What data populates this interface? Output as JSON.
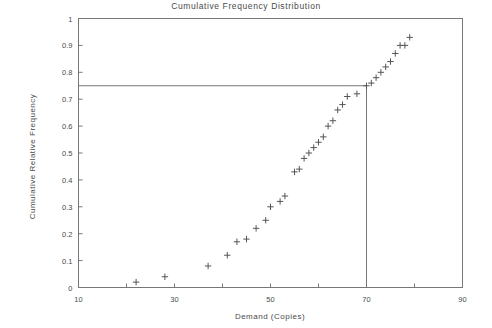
{
  "chart_data": {
    "type": "scatter",
    "title": "Cumulative Frequency Distribution",
    "xlabel": "Demand (Copies)",
    "ylabel": "Cumulative Relative Frequency",
    "xlim": [
      10,
      90
    ],
    "ylim": [
      0,
      1
    ],
    "grid": false,
    "legend": null,
    "marker": "+",
    "marker_color": "#555555",
    "xticks": [
      10,
      20,
      30,
      40,
      50,
      60,
      70,
      80,
      90
    ],
    "xtick_labels": [
      "10",
      "",
      "30",
      "",
      "50",
      "",
      "70",
      "",
      "90"
    ],
    "yticks": [
      0,
      0.1,
      0.2,
      0.3,
      0.4,
      0.5,
      0.6,
      0.7,
      0.8,
      0.9,
      1
    ],
    "ytick_labels": [
      "0",
      "0.1",
      "0.2",
      "0.3",
      "0.4",
      "0.5",
      "0.6",
      "0.7",
      "0.8",
      "0.9",
      "1"
    ],
    "x": [
      22,
      28,
      37,
      41,
      43,
      45,
      47,
      49,
      50,
      52,
      53,
      55,
      56,
      57,
      58,
      59,
      60,
      61,
      62,
      63,
      64,
      65,
      66,
      68,
      70,
      71,
      72,
      73,
      74,
      75,
      76,
      77,
      78,
      79
    ],
    "values": [
      0.02,
      0.04,
      0.08,
      0.12,
      0.17,
      0.18,
      0.22,
      0.25,
      0.3,
      0.32,
      0.34,
      0.43,
      0.44,
      0.48,
      0.5,
      0.52,
      0.54,
      0.56,
      0.6,
      0.62,
      0.66,
      0.68,
      0.71,
      0.72,
      0.75,
      0.76,
      0.78,
      0.8,
      0.82,
      0.84,
      0.87,
      0.9,
      0.9,
      0.93
    ],
    "annotations": [
      {
        "name": "percentile-reference-line",
        "type": "hv-line",
        "y": 0.75,
        "x": 70,
        "description": "Horizontal line at cumulative relative frequency 0.75 meeting vertical line down to demand 70"
      }
    ]
  }
}
